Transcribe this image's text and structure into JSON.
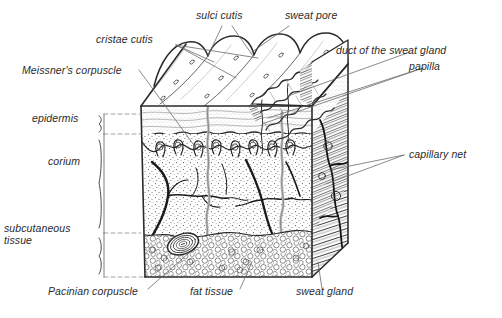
{
  "figure": {
    "kind": "anatomical-block-diagram",
    "background_color": "#ffffff",
    "ink_color": "#2b2b2b"
  },
  "labels": {
    "cristae_cutis": "cristae cutis",
    "sulci_cutis": "sulci cutis",
    "sweat_pore": "sweat pore",
    "meissners_corpuscle": "Meissner's corpuscle",
    "duct_of_the_sweat_gland": "duct of the sweat gland",
    "papilla": "papilla",
    "capillary_net": "capillary net",
    "pacinian_corpuscle": "Pacinian corpuscle",
    "fat_tissue": "fat tissue",
    "sweat_gland": "sweat gland"
  },
  "layer_brackets": {
    "epidermis": "epidermis",
    "corium": "corium",
    "subcutaneous_tissue": "subcutaneous tissue"
  }
}
